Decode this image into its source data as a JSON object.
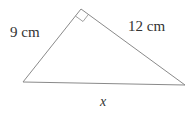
{
  "diagram": {
    "type": "right-triangle",
    "labels": {
      "left_side": "9 cm",
      "right_side": "12 cm",
      "base": "x"
    },
    "colors": {
      "stroke": "#8a8a8a",
      "text": "#333333"
    },
    "right_angle_at": "apex"
  }
}
